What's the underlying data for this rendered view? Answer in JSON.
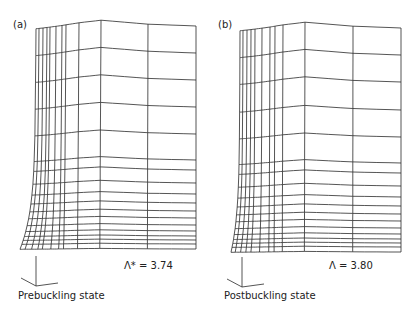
{
  "panels": [
    {
      "tag": "(a)",
      "state_label": "Prebuckling state",
      "value_label": "Λ* = 3.74",
      "symbol": "Λ",
      "superscript": "*",
      "value": 3.74
    },
    {
      "tag": "(b)",
      "state_label": "Postbuckling state",
      "value_label": "Λ = 3.80",
      "symbol": "Λ",
      "superscript": "",
      "value": 3.8
    }
  ],
  "colors": {
    "line": "#2a2a2a",
    "background": "#ffffff"
  }
}
